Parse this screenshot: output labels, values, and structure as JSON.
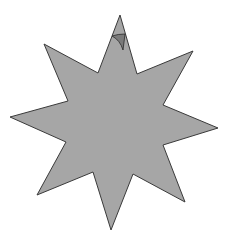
{
  "shape": {
    "type": "eight-point-star",
    "fill": "#a6a6a6",
    "stroke": "#3a3a3a",
    "points": "120,15 137,74 193,51 163,105 218,128 163,145 185,202 133,174 111,230 93,172 37,195 66,142 10,117 68,101 44,44 98,73"
  },
  "marker": {
    "type": "rotation-handle",
    "fill": "#7a7a7a",
    "stroke": "#2a2a2a"
  }
}
